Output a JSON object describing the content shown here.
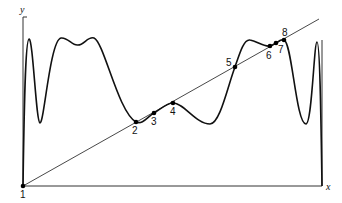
{
  "diagram": {
    "axes": {
      "x_label": "x",
      "y_label": "y"
    },
    "colors": {
      "curve": "#111111",
      "line": "#333333",
      "axis": "#333333",
      "point": "#000000"
    },
    "intersection_points": [
      {
        "label": "1",
        "x": 23,
        "y": 186,
        "lx": 20,
        "ly": 198
      },
      {
        "label": "2",
        "x": 136,
        "y": 122,
        "lx": 132,
        "ly": 134
      },
      {
        "label": "3",
        "x": 154,
        "y": 113,
        "lx": 151,
        "ly": 125
      },
      {
        "label": "4",
        "x": 173,
        "y": 103,
        "lx": 170,
        "ly": 115
      },
      {
        "label": "5",
        "x": 235,
        "y": 67,
        "lx": 226,
        "ly": 66
      },
      {
        "label": "6",
        "x": 270,
        "y": 46,
        "lx": 266,
        "ly": 59
      },
      {
        "label": "7",
        "x": 276,
        "y": 43,
        "lx": 278,
        "ly": 53
      },
      {
        "label": "8",
        "x": 284,
        "y": 40,
        "lx": 282,
        "ly": 36
      }
    ]
  }
}
